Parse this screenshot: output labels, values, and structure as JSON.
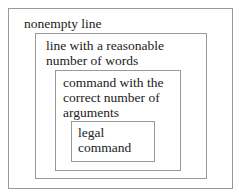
{
  "diagram": {
    "type": "nested-boxes",
    "border_color": "#9a9a9a",
    "text_color": "#222222",
    "levels": [
      {
        "level": 1,
        "label": "nonempty line"
      },
      {
        "level": 2,
        "label": "line with a reasonable\nnumber of words"
      },
      {
        "level": 3,
        "label": "command with the\ncorrect number of\narguments"
      },
      {
        "level": 4,
        "label": "legal\ncommand"
      }
    ]
  }
}
